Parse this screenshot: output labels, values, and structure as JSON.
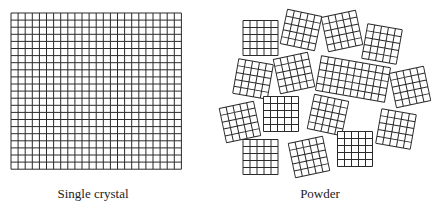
{
  "figure": {
    "colors": {
      "background": "#ffffff",
      "line": "#2a2a2a",
      "text": "#222222"
    },
    "single_crystal": {
      "label": "Single crystal",
      "grid": {
        "x": 11,
        "y": 13,
        "cols": 24,
        "rows": 22,
        "cell": 7.1
      },
      "label_pos": {
        "x": 93,
        "y": 186
      }
    },
    "powder": {
      "label": "Powder",
      "label_pos": {
        "x": 320,
        "y": 186
      },
      "cell": 7,
      "grains": [
        {
          "cx": 260.5,
          "cy": 38,
          "cols": 5,
          "rows": 5,
          "rot": 0
        },
        {
          "cx": 301,
          "cy": 30,
          "cols": 5,
          "rows": 5,
          "rot": 12
        },
        {
          "cx": 342,
          "cy": 31,
          "cols": 5,
          "rows": 5,
          "rot": -12
        },
        {
          "cx": 382,
          "cy": 44,
          "cols": 5,
          "rows": 5,
          "rot": 10
        },
        {
          "cx": 253,
          "cy": 79,
          "cols": 5,
          "rows": 5,
          "rot": 10
        },
        {
          "cx": 294,
          "cy": 73,
          "cols": 5,
          "rows": 5,
          "rot": -12
        },
        {
          "cx": 353,
          "cy": 79,
          "cols": 10,
          "rows": 5,
          "rot": 10
        },
        {
          "cx": 410,
          "cy": 87,
          "cols": 5,
          "rows": 5,
          "rot": -12
        },
        {
          "cx": 240,
          "cy": 122,
          "cols": 5,
          "rows": 5,
          "rot": -12
        },
        {
          "cx": 281,
          "cy": 114,
          "cols": 5,
          "rows": 5,
          "rot": 0
        },
        {
          "cx": 328,
          "cy": 115,
          "cols": 5,
          "rows": 5,
          "rot": 12
        },
        {
          "cx": 396,
          "cy": 129,
          "cols": 5,
          "rows": 5,
          "rot": 10
        },
        {
          "cx": 260.5,
          "cy": 157,
          "cols": 5,
          "rows": 5,
          "rot": 0
        },
        {
          "cx": 309,
          "cy": 157,
          "cols": 5,
          "rows": 5,
          "rot": -12
        },
        {
          "cx": 355,
          "cy": 149,
          "cols": 5,
          "rows": 5,
          "rot": 0
        }
      ]
    }
  }
}
